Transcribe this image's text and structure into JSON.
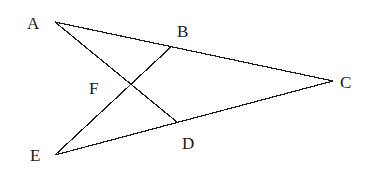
{
  "diagram": {
    "type": "geometry",
    "points": {
      "A": {
        "label": "A",
        "x": 55,
        "y": 22,
        "label_x": 27,
        "label_y": 29
      },
      "B": {
        "label": "B",
        "x": 172,
        "y": 46,
        "label_x": 177,
        "label_y": 37
      },
      "C": {
        "label": "C",
        "x": 333,
        "y": 81,
        "label_x": 340,
        "label_y": 88
      },
      "D": {
        "label": "D",
        "x": 177,
        "y": 122,
        "label_x": 182,
        "label_y": 149
      },
      "E": {
        "label": "E",
        "x": 55,
        "y": 155,
        "label_x": 30,
        "label_y": 161
      },
      "F": {
        "label": "F",
        "x": 131,
        "y": 86,
        "label_x": 89,
        "label_y": 94
      }
    },
    "segments": [
      {
        "name": "segment-AC",
        "from": "A",
        "to": "C"
      },
      {
        "name": "segment-EC",
        "from": "E",
        "to": "C"
      },
      {
        "name": "segment-AD",
        "from": "A",
        "to": "D"
      },
      {
        "name": "segment-EB",
        "from": "E",
        "to": "B"
      }
    ],
    "stroke_color": "#1a1a1a",
    "background": "#ffffff"
  }
}
